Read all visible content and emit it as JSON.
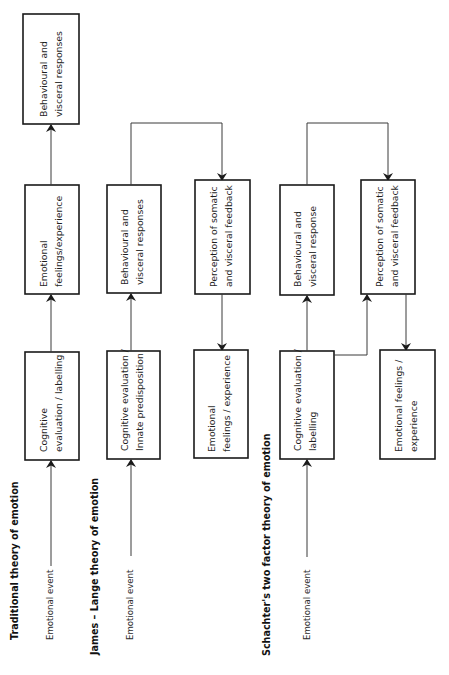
{
  "diagrams": {
    "traditional": {
      "title": "Traditional theory of emotion",
      "event": "Emotional event",
      "boxes": [
        {
          "line1": "Cognitive",
          "line2": "evaluation / labelling"
        },
        {
          "line1": "Emotional",
          "line2": "feelings/experience"
        },
        {
          "line1": "Behavioural and",
          "line2": "visceral responses"
        }
      ]
    },
    "james_lange": {
      "title": "James – Lange theory of emotion",
      "event": "Emotional event",
      "boxes": [
        {
          "line1": "Cognitive evaluation /",
          "line2": "Innate predisposition"
        },
        {
          "line1": "Behavioural and",
          "line2": "visceral responses"
        },
        {
          "line1": "Perception of somatic",
          "line2": "and visceral feedback"
        },
        {
          "line1": "Emotional",
          "line2": "feelings / experience"
        }
      ]
    },
    "schachter": {
      "title": "Schachter's two factor theory of emotion",
      "event": "Emotional event",
      "boxes": [
        {
          "line1": "Cognitive evaluation /",
          "line2": "labelling"
        },
        {
          "line1": "Behavioural and",
          "line2": "visceral response"
        },
        {
          "line1": "Perception of somatic",
          "line2": "and visceral feedback"
        },
        {
          "line1": "Emotional feelings /",
          "line2": "experience"
        }
      ]
    }
  },
  "colors": {
    "stroke": "#1a1a1a",
    "background": "#ffffff"
  }
}
